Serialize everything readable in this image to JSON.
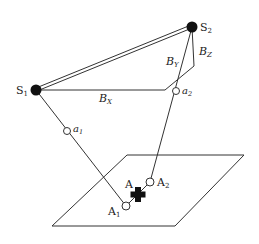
{
  "diagram": {
    "type": "stereo-projection-geometry",
    "colors": {
      "line": "#333333",
      "fill_dark": "#111111",
      "background": "#ffffff"
    },
    "sources": [
      {
        "id": "S1",
        "label": "S",
        "sub": "1"
      },
      {
        "id": "S2",
        "label": "S",
        "sub": "2"
      }
    ],
    "baseline_components": [
      {
        "id": "BX",
        "label": "B",
        "sub": "X"
      },
      {
        "id": "BY",
        "label": "B",
        "sub": "Y"
      },
      {
        "id": "BZ",
        "label": "B",
        "sub": "Z"
      }
    ],
    "image_points": [
      {
        "id": "a1",
        "label": "a",
        "sub": "1"
      },
      {
        "id": "a2",
        "label": "a",
        "sub": "2"
      }
    ],
    "ground_points": [
      {
        "id": "A1",
        "label": "A",
        "sub": "1"
      },
      {
        "id": "A2",
        "label": "A",
        "sub": "2"
      }
    ],
    "target": {
      "id": "A",
      "label": "A",
      "marker": "cross"
    }
  }
}
